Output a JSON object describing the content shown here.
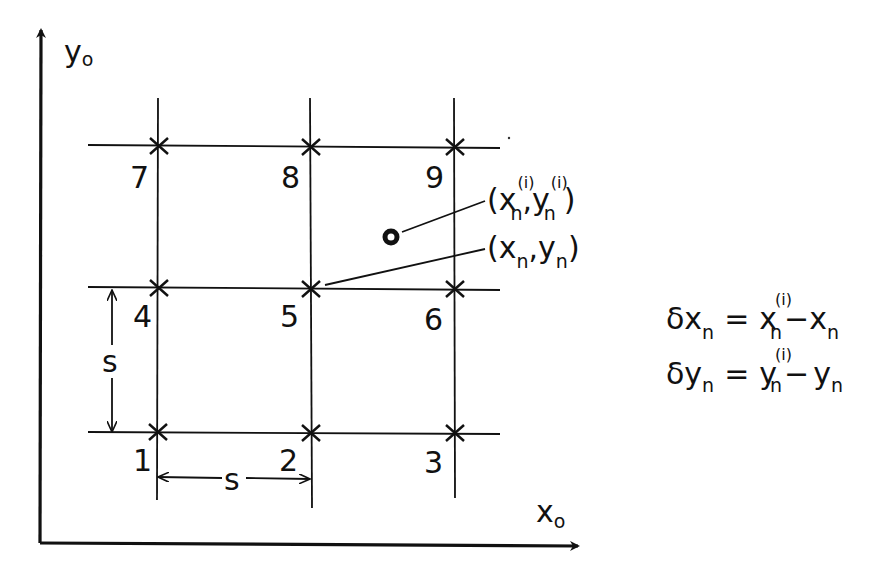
{
  "diagram": {
    "type": "grid-displacement-schematic",
    "axes": {
      "x_label": "x",
      "x_sub": "o",
      "y_label": "y",
      "y_sub": "o"
    },
    "grid": {
      "spacing_label": "s",
      "nodes": [
        {
          "id": "1",
          "label": "1"
        },
        {
          "id": "2",
          "label": "2"
        },
        {
          "id": "3",
          "label": "3"
        },
        {
          "id": "4",
          "label": "4"
        },
        {
          "id": "5",
          "label": "5"
        },
        {
          "id": "6",
          "label": "6"
        },
        {
          "id": "7",
          "label": "7"
        },
        {
          "id": "8",
          "label": "8"
        },
        {
          "id": "9",
          "label": "9"
        }
      ]
    },
    "annotations": {
      "measured_point": {
        "open": "(",
        "x": "x",
        "x_sub": "n",
        "x_sup": "(i)",
        "comma": ",",
        "y": "y",
        "y_sub": "n",
        "y_sup": "(i)",
        "close": ")"
      },
      "reference_point": {
        "open": "(",
        "x": "x",
        "x_sub": "n",
        "comma": ",",
        "y": "y",
        "y_sub": "n",
        "close": ")"
      }
    },
    "equations": [
      {
        "lhs": "δx",
        "lhs_sub": "n",
        "eq": "=",
        "term1": "x",
        "term1_sub": "n",
        "term1_sup": "(i)",
        "minus": "−",
        "term2": "x",
        "term2_sub": "n"
      },
      {
        "lhs": "δy",
        "lhs_sub": "n",
        "eq": "=",
        "term1": "y",
        "term1_sub": "n",
        "term1_sup": "(i)",
        "minus": "−",
        "term2": "y",
        "term2_sub": "n"
      }
    ]
  }
}
